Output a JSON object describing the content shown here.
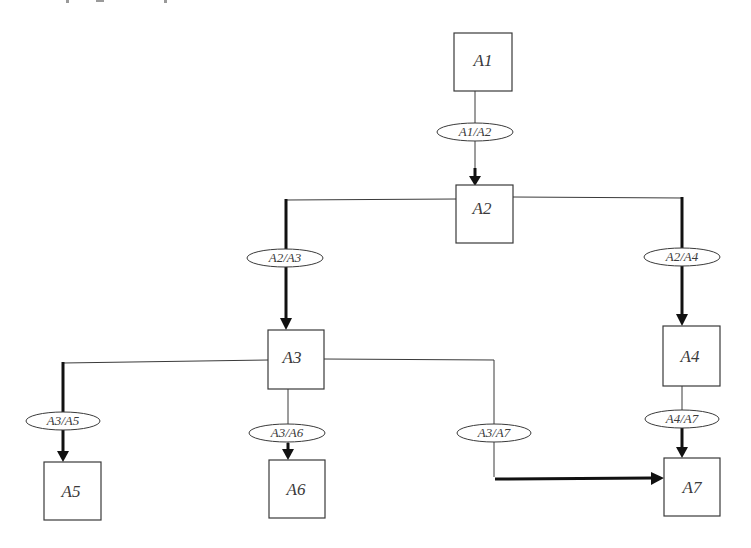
{
  "diagram": {
    "type": "directed-tree",
    "colors": {
      "stroke": "#3a3a3a",
      "thick_edge": "#111111",
      "background": "#ffffff"
    },
    "nodes": {
      "A1": {
        "label": "A1"
      },
      "A2": {
        "label": "A2"
      },
      "A3": {
        "label": "A3"
      },
      "A4": {
        "label": "A4"
      },
      "A5": {
        "label": "A5"
      },
      "A6": {
        "label": "A6"
      },
      "A7": {
        "label": "A7"
      }
    },
    "edges": {
      "A1_A2": {
        "from": "A1",
        "to": "A2",
        "label": "A1/A2"
      },
      "A2_A3": {
        "from": "A2",
        "to": "A3",
        "label": "A2/A3"
      },
      "A2_A4": {
        "from": "A2",
        "to": "A4",
        "label": "A2/A4"
      },
      "A3_A5": {
        "from": "A3",
        "to": "A5",
        "label": "A3/A5"
      },
      "A3_A6": {
        "from": "A3",
        "to": "A6",
        "label": "A3/A6"
      },
      "A3_A7": {
        "from": "A3",
        "to": "A7",
        "label": "A3/A7"
      },
      "A4_A7": {
        "from": "A4",
        "to": "A7",
        "label": "A4/A7"
      }
    }
  }
}
